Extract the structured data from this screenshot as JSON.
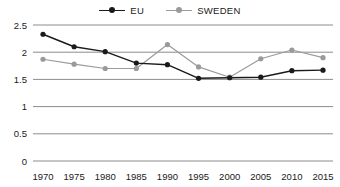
{
  "chart_data": {
    "type": "line",
    "title": "",
    "xlabel": "",
    "ylabel": "",
    "categories": [
      "1970",
      "1975",
      "1980",
      "1985",
      "1990",
      "1995",
      "2000",
      "2005",
      "2010",
      "2015"
    ],
    "x": [
      1970,
      1975,
      1980,
      1985,
      1990,
      1995,
      2000,
      2005,
      2010,
      2015
    ],
    "series": [
      {
        "name": "EU",
        "color": "#1a1a1a",
        "marker": "filled-circle",
        "values": [
          2.33,
          2.1,
          2.01,
          1.8,
          1.77,
          1.52,
          1.53,
          1.54,
          1.66,
          1.67
        ]
      },
      {
        "name": "SWEDEN",
        "color": "#9a9a9a",
        "marker": "filled-circle",
        "values": [
          1.87,
          1.78,
          1.7,
          1.7,
          2.14,
          1.73,
          1.54,
          1.88,
          2.04,
          1.9
        ]
      }
    ],
    "ylim": [
      0,
      2.5
    ],
    "yticks": [
      0,
      0.5,
      1,
      1.5,
      2,
      2.5
    ],
    "ytick_labels": [
      "0",
      "0.5",
      "1",
      "1.5",
      "2",
      "2.5"
    ],
    "grid": true,
    "grid_axis": "y",
    "legend_position": "top-center"
  },
  "legend": {
    "entries": [
      {
        "label": "EU"
      },
      {
        "label": "SWEDEN"
      }
    ]
  },
  "colors": {
    "eu": "#1a1a1a",
    "sweden": "#9a9a9a",
    "gridline": "#8c8c8c",
    "background": "#ffffff"
  }
}
